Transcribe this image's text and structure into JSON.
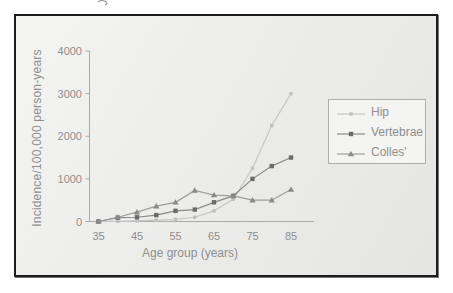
{
  "figure": {
    "panel_border_color": "#1c1c1c",
    "panel_background": "#ededeb",
    "axis_color": "#a9a9a9",
    "text_color": "#8f8f8f",
    "legend_border_color": "#adadad",
    "legend_background": "#f4f4f3"
  },
  "chart_data": {
    "type": "line",
    "title": "",
    "xlabel": "Age group (years)",
    "ylabel": "Incidence/100,000 person-years",
    "x": [
      35,
      40,
      45,
      50,
      55,
      60,
      65,
      70,
      75,
      80,
      85
    ],
    "x_ticks": [
      35,
      45,
      55,
      65,
      75,
      85
    ],
    "y_ticks": [
      0,
      1000,
      2000,
      3000,
      4000
    ],
    "xlim": [
      35,
      91
    ],
    "ylim": [
      0,
      4000
    ],
    "grid": false,
    "legend_position": "right",
    "series": [
      {
        "name": "Hip",
        "marker": "square-small",
        "color": "#c7c7c7",
        "marker_color": "#c0c0c0",
        "values": [
          0,
          5,
          15,
          30,
          50,
          100,
          250,
          520,
          1250,
          2250,
          3000
        ]
      },
      {
        "name": "Vertebrae",
        "marker": "square",
        "color": "#8a8a8a",
        "marker_color": "#6b6b6b",
        "values": [
          0,
          90,
          100,
          150,
          250,
          280,
          450,
          600,
          1000,
          1300,
          1500
        ]
      },
      {
        "name": "Colles'",
        "marker": "triangle",
        "color": "#9f9f9f",
        "marker_color": "#8a8a8a",
        "values": [
          0,
          100,
          220,
          360,
          450,
          730,
          620,
          600,
          500,
          500,
          750
        ]
      }
    ]
  }
}
